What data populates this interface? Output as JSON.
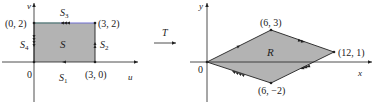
{
  "left_panel": {
    "axes": {
      "horizontal": "u",
      "vertical": "v"
    },
    "origin_label": "0",
    "region_label": "S",
    "region_color": "#b3b3b3",
    "vertices": [
      {
        "label": "(0, 2)"
      },
      {
        "label": "(3, 2)"
      },
      {
        "label": "(3, 0)"
      }
    ],
    "sides": [
      {
        "name": "S",
        "sub": "1"
      },
      {
        "name": "S",
        "sub": "2"
      },
      {
        "name": "S",
        "sub": "3"
      },
      {
        "name": "S",
        "sub": "4"
      }
    ],
    "top_edge_color": "#6f6fd0"
  },
  "transform": {
    "label": "T"
  },
  "right_panel": {
    "axes": {
      "horizontal": "x",
      "vertical": "y"
    },
    "origin_label": "0",
    "region_label": "R",
    "region_color": "#b3b3b3",
    "vertices": [
      {
        "label": "(6, 3)"
      },
      {
        "label": "(12, 1)"
      },
      {
        "label": "(6, −2)"
      }
    ]
  }
}
